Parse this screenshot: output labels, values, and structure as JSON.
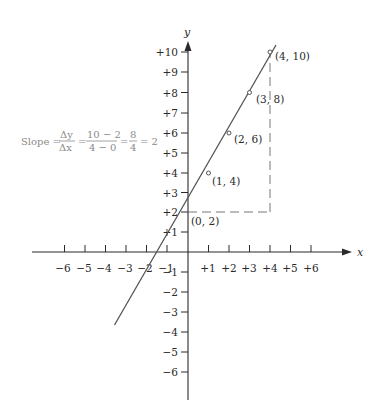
{
  "axes": {
    "x_label": "x",
    "y_label": "y",
    "x_ticks": [
      "−6",
      "−5",
      "−4",
      "−3",
      "−2",
      "−1",
      "+1",
      "+2",
      "+3",
      "+4",
      "+5",
      "+6"
    ],
    "y_ticks_pos": [
      "+1",
      "+2",
      "+3",
      "+4",
      "+5",
      "+6",
      "+7",
      "+8",
      "+9",
      "+10"
    ],
    "y_ticks_neg": [
      "−1",
      "−2",
      "−3",
      "−4",
      "−5",
      "−6"
    ]
  },
  "points": [
    {
      "label": "(0, 2)",
      "x": 0,
      "y": 2
    },
    {
      "label": "(1, 4)",
      "x": 1,
      "y": 4
    },
    {
      "label": "(2, 6)",
      "x": 2,
      "y": 6
    },
    {
      "label": "(3, 8)",
      "x": 3,
      "y": 8
    },
    {
      "label": "(4, 10)",
      "x": 4,
      "y": 10
    }
  ],
  "slope": {
    "prefix": "Slope =",
    "dy": "Δy",
    "dx": "Δx",
    "num": "10 − 2",
    "den": "4 − 0",
    "num2": "8",
    "den2": "4",
    "result": "= 2",
    "eq": "="
  },
  "line": {
    "equation": "y = 2x + 2",
    "x_start": -3.6,
    "x_end": 4.3
  },
  "colors": {
    "line": "#555555",
    "axis": "#2a2a2a",
    "dashed": "#777777",
    "formula": "#8a8a8a"
  }
}
